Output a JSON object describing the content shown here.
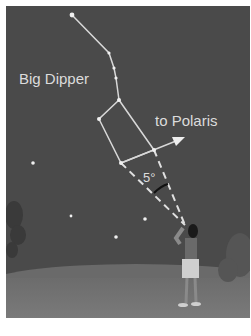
{
  "figure": {
    "title_label": "Big Dipper",
    "direction_label": "to Polaris",
    "angle_label": "5°",
    "colors": {
      "sky": "#4a4a4a",
      "ground": "#727272",
      "lines": "#d8d8d8",
      "stars": "#f0f0f0",
      "angle_arc": "#111111",
      "frame_bg": "#ffffff"
    },
    "stars": [
      {
        "name": "handle-end",
        "x": 72,
        "y": 15
      },
      {
        "name": "handle-2",
        "x": 109,
        "y": 53
      },
      {
        "name": "handle-3",
        "x": 114,
        "y": 68
      },
      {
        "name": "handle-4",
        "x": 116,
        "y": 78
      },
      {
        "name": "bowl-top",
        "x": 119,
        "y": 100
      },
      {
        "name": "bowl-left",
        "x": 99,
        "y": 119
      },
      {
        "name": "bowl-bottom",
        "x": 121,
        "y": 163
      },
      {
        "name": "bowl-right",
        "x": 154,
        "y": 150
      }
    ],
    "background_stars": [
      {
        "x": 33,
        "y": 163
      },
      {
        "x": 71,
        "y": 216
      },
      {
        "x": 145,
        "y": 219
      },
      {
        "x": 116,
        "y": 237
      }
    ]
  }
}
